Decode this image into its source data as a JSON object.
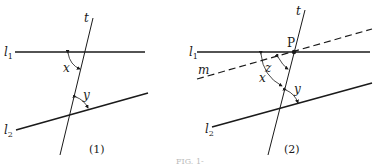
{
  "figure_caption": "FIG. 1-",
  "panels": [
    {
      "id": "1",
      "caption": "(1)",
      "lines": {
        "l1": {
          "label": "l",
          "subscript": "1",
          "style": "solid"
        },
        "l2": {
          "label": "l",
          "subscript": "2",
          "style": "solid"
        },
        "t": {
          "label": "t",
          "style": "solid"
        }
      },
      "angles": [
        {
          "label": "x",
          "between": "l1 and t"
        },
        {
          "label": "y",
          "between": "t and l2"
        }
      ]
    },
    {
      "id": "2",
      "caption": "(2)",
      "lines": {
        "l1": {
          "label": "l",
          "subscript": "1",
          "style": "solid"
        },
        "l2": {
          "label": "l",
          "subscript": "2",
          "style": "solid"
        },
        "t": {
          "label": "t",
          "style": "solid"
        },
        "m": {
          "label": "m",
          "style": "dashed"
        }
      },
      "points": [
        {
          "label": "P"
        }
      ],
      "angles": [
        {
          "label": "x",
          "between": "l1 and t"
        },
        {
          "label": "z",
          "between": "m and t"
        },
        {
          "label": "y",
          "between": "t and l2"
        }
      ]
    }
  ]
}
